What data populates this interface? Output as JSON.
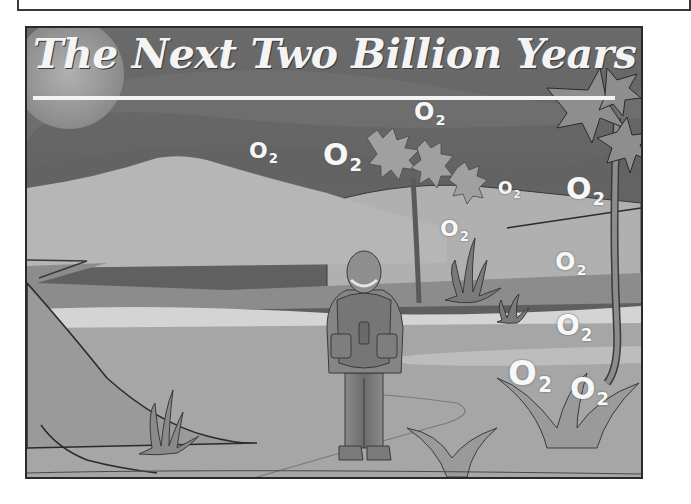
{
  "header_box": {},
  "poster": {
    "title": "The Next Two Billion Years",
    "colors": {
      "sky_dark": "#5c5c5c",
      "sky_mid": "#6e6e6e",
      "sun": "#9a9a9a",
      "hill_light": "#b4b4b4",
      "ground": "#a8a8a8",
      "lake": "#d2d2d2",
      "outline": "#2a2a2a",
      "text": "#f4f4f4"
    },
    "oxygen_labels": [
      {
        "main": "O",
        "sub": "2",
        "x": 222,
        "y": 112,
        "size": 22
      },
      {
        "main": "O",
        "sub": "2",
        "x": 296,
        "y": 112,
        "size": 30
      },
      {
        "main": "O",
        "sub": "2",
        "x": 387,
        "y": 72,
        "size": 24
      },
      {
        "main": "O",
        "sub": "2",
        "x": 471,
        "y": 152,
        "size": 17
      },
      {
        "main": "O",
        "sub": "2",
        "x": 539,
        "y": 146,
        "size": 30
      },
      {
        "main": "O",
        "sub": "2",
        "x": 413,
        "y": 190,
        "size": 22
      },
      {
        "main": "O",
        "sub": "2",
        "x": 528,
        "y": 222,
        "size": 24
      },
      {
        "main": "O",
        "sub": "2",
        "x": 529,
        "y": 284,
        "size": 28
      },
      {
        "main": "O",
        "sub": "2",
        "x": 481,
        "y": 328,
        "size": 34
      },
      {
        "main": "O",
        "sub": "2",
        "x": 543,
        "y": 346,
        "size": 30
      }
    ]
  }
}
